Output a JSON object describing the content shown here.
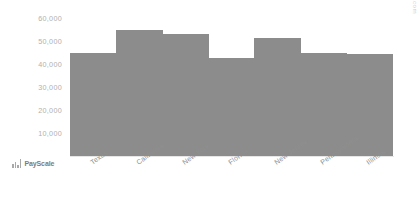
{
  "chart_data": {
    "type": "bar",
    "title": "",
    "xlabel": "",
    "ylabel": "",
    "categories": [
      "Texas",
      "California",
      "New York",
      "Florida",
      "New Jersey",
      "Pennsylvania",
      "Illinois"
    ],
    "values": [
      42000,
      51000,
      49500,
      40000,
      48000,
      42000,
      41500
    ],
    "ylim": [
      0,
      60000
    ],
    "yticks": [
      60000,
      50000,
      40000,
      30000,
      20000,
      10000
    ],
    "ytick_labels": [
      "60,000",
      "50,000",
      "40,000",
      "30,000",
      "20,000",
      "10,000"
    ],
    "grid": false,
    "legend": false,
    "bar_color": "#8c8c8c",
    "axis_text_color": "#b0b0b0",
    "category_text_color": "#8f8f8f"
  },
  "watermark": {
    "text": "© PayScale, Inc. © www.payscale.com",
    "color": "#cfcfcf"
  },
  "brand": {
    "name": "PayScale",
    "mark": "bar-chart-icon",
    "color": "#7c7c7c"
  },
  "background": "#ffffff"
}
